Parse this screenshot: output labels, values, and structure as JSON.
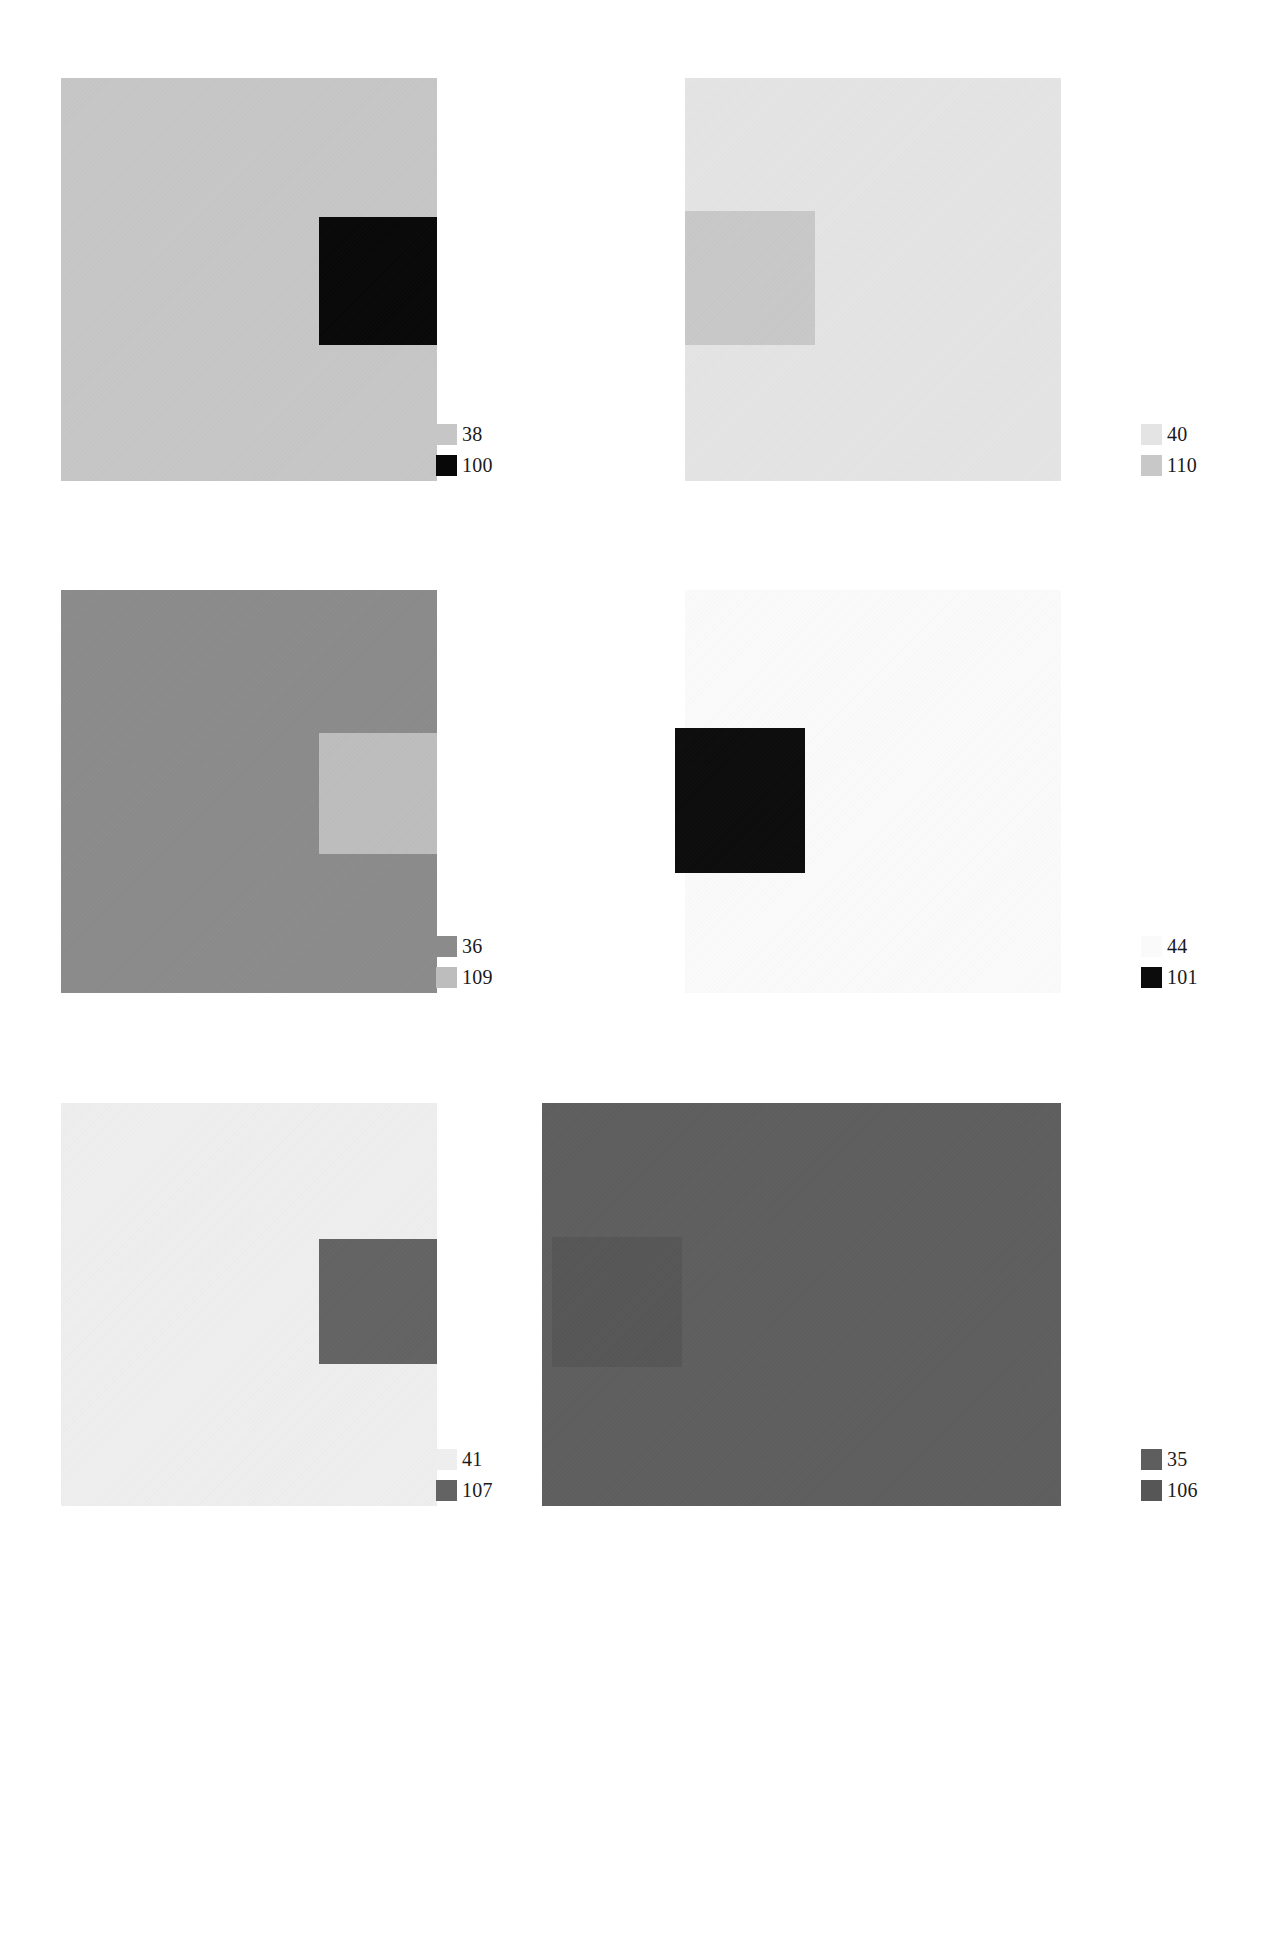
{
  "page": {
    "width": 1276,
    "height": 1933,
    "background": "#ffffff"
  },
  "chart_data": {
    "type": "heatmap",
    "subtitle": "Six paired grey-value colour fields with inset patches",
    "xlabel": "",
    "ylabel": "",
    "grid": false,
    "legend_position": "bottom-right of each plate",
    "layout": {
      "rows": 3,
      "columns": 2
    },
    "categories": [
      "plate-1",
      "plate-2",
      "plate-3",
      "plate-4",
      "plate-5",
      "plate-6"
    ],
    "series": [
      {
        "name": "field",
        "values": [
          38,
          40,
          36,
          44,
          41,
          35
        ]
      },
      {
        "name": "patch",
        "values": [
          100,
          110,
          109,
          101,
          107,
          106
        ]
      }
    ],
    "panels": [
      {
        "id": "plate-1",
        "field_label": "38",
        "field_color": "#c6c6c6",
        "patch_label": "100",
        "patch_color": "#080808",
        "patch_position": "right",
        "frame": {
          "x": 61,
          "y": 78,
          "w": 376,
          "h": 403
        },
        "patch_rect": {
          "x": 258,
          "y": 139,
          "w": 118,
          "h": 128
        }
      },
      {
        "id": "plate-2",
        "field_label": "40",
        "field_color": "#e4e4e4",
        "patch_label": "110",
        "patch_color": "#c8c8c8",
        "patch_position": "left",
        "frame": {
          "x": 685,
          "y": 78,
          "w": 376,
          "h": 403
        },
        "patch_rect": {
          "x": 0,
          "y": 133,
          "w": 130,
          "h": 134
        }
      },
      {
        "id": "plate-3",
        "field_label": "36",
        "field_color": "#8b8b8b",
        "patch_label": "109",
        "patch_color": "#bdbdbd",
        "patch_position": "right",
        "frame": {
          "x": 61,
          "y": 590,
          "w": 376,
          "h": 403
        },
        "patch_rect": {
          "x": 258,
          "y": 143,
          "w": 118,
          "h": 121
        }
      },
      {
        "id": "plate-4",
        "field_label": "44",
        "field_color": "#fafafa",
        "patch_label": "101",
        "patch_color": "#0c0c0c",
        "patch_position": "left-inset",
        "frame": {
          "x": 685,
          "y": 590,
          "w": 376,
          "h": 403
        },
        "patch_rect": {
          "x": -10,
          "y": 138,
          "w": 130,
          "h": 145
        }
      },
      {
        "id": "plate-5",
        "field_label": "41",
        "field_color": "#eeeeee",
        "patch_label": "107",
        "patch_color": "#636363",
        "patch_position": "right",
        "frame": {
          "x": 61,
          "y": 1103,
          "w": 376,
          "h": 403
        },
        "patch_rect": {
          "x": 258,
          "y": 136,
          "w": 118,
          "h": 125
        }
      },
      {
        "id": "plate-6",
        "field_label": "35",
        "field_color": "#5e5e5e",
        "patch_label": "106",
        "patch_color": "#565656",
        "patch_position": "left",
        "frame": {
          "x": 542,
          "y": 1103,
          "w": 519,
          "h": 403
        },
        "patch_rect": {
          "x": 10,
          "y": 134,
          "w": 130,
          "h": 130
        }
      }
    ]
  }
}
